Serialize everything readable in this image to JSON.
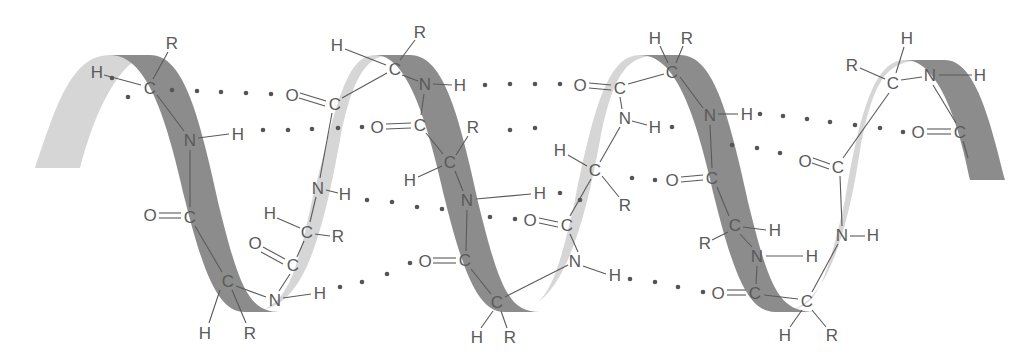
{
  "diagram": {
    "colors": {
      "background": "#ffffff",
      "ribbon_front": "#8c8c8c",
      "ribbon_back": "#d6d6d6",
      "atom_text": "#5a5a5a",
      "hbond_dots": "#555555"
    },
    "ribbons": {
      "back": [
        "M 35 168 C 55 110, 70 55, 110 55 L 148 55 C 120 60, 95 110, 80 168 Z",
        "M 255 310 C 300 310, 320 250, 340 140 C 355 60, 375 55, 395 55 L 375 55 C 345 55, 335 110, 310 210 C 295 280, 285 305, 255 312 Z",
        "M 510 312 C 555 312, 580 250, 600 140 C 615 65, 630 55, 665 55 L 640 55 C 610 55, 595 100, 575 200 C 555 290, 545 310, 510 312 Z",
        "M 780 312 C 820 312, 845 250, 860 150 C 875 70, 890 60, 930 60 L 905 60 C 875 60, 860 110, 845 200 C 825 290, 815 310, 780 312 Z"
      ],
      "front": [
        "M 110 55 L 150 55 C 185 55, 200 120, 220 210 C 240 290, 250 312, 280 312 L 245 312 C 220 312, 205 280, 185 200 C 165 110, 145 55, 110 55 Z",
        "M 375 55 L 410 55 C 445 55, 460 120, 480 210 C 500 290, 510 312, 540 312 L 505 312 C 480 312, 465 280, 445 200 C 425 110, 405 55, 375 55 Z",
        "M 640 55 L 680 55 C 715 55, 730 120, 750 210 C 770 290, 780 312, 815 312 L 775 312 C 750 312, 735 280, 715 200 C 695 110, 675 55, 640 55 Z",
        "M 905 60 L 945 60 C 975 60, 990 120, 1005 180 L 970 180 C 960 130, 940 60, 905 60 Z"
      ]
    },
    "atoms": [
      {
        "label": "H",
        "x": 97,
        "y": 72
      },
      {
        "label": "C",
        "x": 150,
        "y": 88
      },
      {
        "label": "R",
        "x": 172,
        "y": 43
      },
      {
        "label": "O",
        "x": 292,
        "y": 95
      },
      {
        "label": "C",
        "x": 335,
        "y": 104
      },
      {
        "label": "N",
        "x": 190,
        "y": 140
      },
      {
        "label": "H",
        "x": 238,
        "y": 134
      },
      {
        "label": "N",
        "x": 318,
        "y": 188
      },
      {
        "label": "H",
        "x": 345,
        "y": 194
      },
      {
        "label": "O",
        "x": 150,
        "y": 215
      },
      {
        "label": "C",
        "x": 190,
        "y": 217
      },
      {
        "label": "H",
        "x": 270,
        "y": 213
      },
      {
        "label": "C",
        "x": 307,
        "y": 232
      },
      {
        "label": "R",
        "x": 338,
        "y": 236
      },
      {
        "label": "O",
        "x": 255,
        "y": 243
      },
      {
        "label": "C",
        "x": 293,
        "y": 265
      },
      {
        "label": "C",
        "x": 228,
        "y": 281
      },
      {
        "label": "N",
        "x": 275,
        "y": 300
      },
      {
        "label": "H",
        "x": 320,
        "y": 293
      },
      {
        "label": "H",
        "x": 205,
        "y": 333
      },
      {
        "label": "R",
        "x": 250,
        "y": 333
      },
      {
        "label": "H",
        "x": 337,
        "y": 45
      },
      {
        "label": "R",
        "x": 420,
        "y": 32
      },
      {
        "label": "C",
        "x": 395,
        "y": 69
      },
      {
        "label": "N",
        "x": 425,
        "y": 84
      },
      {
        "label": "H",
        "x": 460,
        "y": 85
      },
      {
        "label": "O",
        "x": 377,
        "y": 127
      },
      {
        "label": "C",
        "x": 420,
        "y": 125
      },
      {
        "label": "R",
        "x": 473,
        "y": 127
      },
      {
        "label": "C",
        "x": 450,
        "y": 162
      },
      {
        "label": "H",
        "x": 410,
        "y": 180
      },
      {
        "label": "N",
        "x": 467,
        "y": 200
      },
      {
        "label": "H",
        "x": 540,
        "y": 193
      },
      {
        "label": "O",
        "x": 425,
        "y": 261
      },
      {
        "label": "C",
        "x": 465,
        "y": 260
      },
      {
        "label": "C",
        "x": 497,
        "y": 302
      },
      {
        "label": "H",
        "x": 477,
        "y": 337
      },
      {
        "label": "R",
        "x": 510,
        "y": 337
      },
      {
        "label": "H",
        "x": 655,
        "y": 38
      },
      {
        "label": "R",
        "x": 687,
        "y": 38
      },
      {
        "label": "C",
        "x": 672,
        "y": 72
      },
      {
        "label": "O",
        "x": 580,
        "y": 85
      },
      {
        "label": "C",
        "x": 620,
        "y": 88
      },
      {
        "label": "N",
        "x": 625,
        "y": 118
      },
      {
        "label": "H",
        "x": 655,
        "y": 127
      },
      {
        "label": "N",
        "x": 710,
        "y": 115
      },
      {
        "label": "H",
        "x": 747,
        "y": 114
      },
      {
        "label": "H",
        "x": 560,
        "y": 150
      },
      {
        "label": "C",
        "x": 595,
        "y": 170
      },
      {
        "label": "R",
        "x": 625,
        "y": 205
      },
      {
        "label": "O",
        "x": 672,
        "y": 180
      },
      {
        "label": "C",
        "x": 712,
        "y": 178
      },
      {
        "label": "O",
        "x": 530,
        "y": 220
      },
      {
        "label": "C",
        "x": 567,
        "y": 225
      },
      {
        "label": "N",
        "x": 575,
        "y": 261
      },
      {
        "label": "H",
        "x": 615,
        "y": 275
      },
      {
        "label": "C",
        "x": 735,
        "y": 225
      },
      {
        "label": "H",
        "x": 775,
        "y": 230
      },
      {
        "label": "R",
        "x": 705,
        "y": 243
      },
      {
        "label": "N",
        "x": 757,
        "y": 256
      },
      {
        "label": "H",
        "x": 812,
        "y": 256
      },
      {
        "label": "O",
        "x": 718,
        "y": 293
      },
      {
        "label": "C",
        "x": 755,
        "y": 293
      },
      {
        "label": "C",
        "x": 807,
        "y": 301
      },
      {
        "label": "H",
        "x": 785,
        "y": 335
      },
      {
        "label": "R",
        "x": 832,
        "y": 335
      },
      {
        "label": "H",
        "x": 907,
        "y": 38
      },
      {
        "label": "R",
        "x": 852,
        "y": 65
      },
      {
        "label": "C",
        "x": 893,
        "y": 83
      },
      {
        "label": "N",
        "x": 930,
        "y": 75
      },
      {
        "label": "H",
        "x": 980,
        "y": 75
      },
      {
        "label": "O",
        "x": 918,
        "y": 132
      },
      {
        "label": "C",
        "x": 960,
        "y": 132
      },
      {
        "label": "O",
        "x": 805,
        "y": 161
      },
      {
        "label": "C",
        "x": 838,
        "y": 167
      },
      {
        "label": "N",
        "x": 842,
        "y": 235
      },
      {
        "label": "H",
        "x": 873,
        "y": 235
      }
    ],
    "hbond_dots": [
      [
        112,
        78
      ],
      [
        128,
        97
      ],
      [
        172,
        90
      ],
      [
        197,
        91
      ],
      [
        221,
        92
      ],
      [
        246,
        93
      ],
      [
        271,
        94
      ],
      [
        263,
        130
      ],
      [
        288,
        130
      ],
      [
        312,
        129
      ],
      [
        338,
        128
      ],
      [
        362,
        127
      ],
      [
        367,
        200
      ],
      [
        392,
        202
      ],
      [
        417,
        207
      ],
      [
        442,
        209
      ],
      [
        490,
        217
      ],
      [
        515,
        219
      ],
      [
        340,
        287
      ],
      [
        362,
        282
      ],
      [
        387,
        274
      ],
      [
        410,
        263
      ],
      [
        485,
        85
      ],
      [
        510,
        84
      ],
      [
        535,
        84
      ],
      [
        560,
        84
      ],
      [
        672,
        127
      ],
      [
        510,
        130
      ],
      [
        535,
        128
      ],
      [
        630,
        279
      ],
      [
        655,
        282
      ],
      [
        678,
        287
      ],
      [
        703,
        292
      ],
      [
        760,
        114
      ],
      [
        783,
        116
      ],
      [
        807,
        119
      ],
      [
        830,
        122
      ],
      [
        855,
        125
      ],
      [
        880,
        128
      ],
      [
        903,
        132
      ],
      [
        732,
        145
      ],
      [
        757,
        148
      ],
      [
        780,
        153
      ],
      [
        632,
        178
      ],
      [
        655,
        180
      ],
      [
        560,
        193
      ],
      [
        580,
        200
      ]
    ]
  }
}
